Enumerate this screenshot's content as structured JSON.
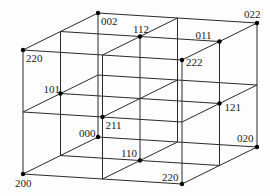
{
  "diagram": {
    "type": "3x3x3 lattice cube (oblique projection)",
    "grid_size": 3,
    "colors": {
      "line": "#2a2a2a",
      "point": "#000000",
      "label": "#222222",
      "background": "#fdfdfd"
    },
    "projection": {
      "origin": [
        23,
        174
      ],
      "u_step": [
        79.5,
        5
      ],
      "v_step": [
        0,
        -62
      ],
      "w_step": [
        37.5,
        -18.5
      ]
    },
    "points": [
      {
        "label": "002",
        "uvw": [
          0,
          2,
          2
        ],
        "label_offset": [
          3,
          12
        ]
      },
      {
        "label": "022",
        "uvw": [
          2,
          2,
          2
        ],
        "label_offset": [
          -13,
          -5
        ]
      },
      {
        "label": "112",
        "uvw": [
          1,
          2,
          1
        ],
        "label_offset": [
          -7,
          -4
        ]
      },
      {
        "label": "220",
        "uvw": [
          0,
          2,
          0
        ],
        "label_offset": [
          3,
          12
        ]
      },
      {
        "label": "222",
        "uvw": [
          2,
          2,
          0
        ],
        "label_offset": [
          4,
          6
        ]
      },
      {
        "label": "011",
        "uvw": [
          2,
          2,
          1
        ],
        "label_offset": [
          -24,
          -3
        ],
        "note": "back-face center"
      },
      {
        "label": "101",
        "uvw": [
          0,
          1,
          1
        ],
        "label_offset": [
          -17,
          -1
        ]
      },
      {
        "label": "121",
        "uvw": [
          2,
          1,
          1
        ],
        "label_offset": [
          5,
          7
        ]
      },
      {
        "label": "211",
        "uvw": [
          1,
          1,
          0
        ],
        "label_offset": [
          3,
          12
        ]
      },
      {
        "label": "000",
        "uvw": [
          0,
          0,
          2
        ],
        "label_offset": [
          -19,
          0
        ]
      },
      {
        "label": "110",
        "uvw": [
          1,
          0,
          1
        ],
        "label_offset": [
          -19,
          -4
        ]
      },
      {
        "label": "020",
        "uvw": [
          2,
          0,
          2
        ],
        "label_offset": [
          -20,
          -5
        ]
      },
      {
        "label": "200",
        "uvw": [
          0,
          0,
          0
        ],
        "label_offset": [
          -8,
          13
        ]
      },
      {
        "label": "220",
        "uvw": [
          2,
          0,
          0
        ],
        "label_offset": [
          -20,
          -3
        ]
      }
    ]
  }
}
